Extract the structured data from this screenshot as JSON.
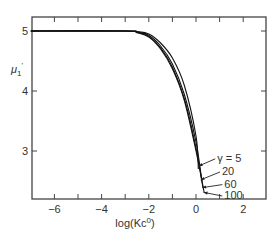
{
  "chart_data": {
    "type": "line",
    "title": "",
    "xlabel": "log(Kc0)",
    "xlabel_display": {
      "base": "log(Kc",
      "sup": "0",
      "tail": ")"
    },
    "ylabel": "μ1'",
    "ylabel_display": {
      "base": "μ",
      "sub": "1",
      "prime": "'"
    },
    "xlim": [
      -7,
      3
    ],
    "ylim": [
      2.2,
      5.25
    ],
    "xticks": [
      -6,
      -5,
      -4,
      -3,
      -2,
      -1,
      0,
      1,
      2
    ],
    "xtick_labels": [
      {
        "v": -6,
        "t": "−6"
      },
      {
        "v": -4,
        "t": "−4"
      },
      {
        "v": -2,
        "t": "−2"
      },
      {
        "v": 0,
        "t": "0"
      },
      {
        "v": 2,
        "t": "2"
      }
    ],
    "yticks": [
      3,
      4,
      5
    ],
    "ytick_labels": [
      {
        "v": 3,
        "t": "3"
      },
      {
        "v": 4,
        "t": "4"
      },
      {
        "v": 5,
        "t": "5"
      }
    ],
    "grid": false,
    "legend": "annotations",
    "series": [
      {
        "name": "γ = 5",
        "label": "γ = 5",
        "x": [
          -7,
          -3,
          -2.5,
          -2,
          -1.5,
          -1,
          -0.5,
          0,
          0.1
        ],
        "y": [
          5,
          5,
          4.99,
          4.95,
          4.8,
          4.55,
          4.1,
          3.25,
          2.7
        ]
      },
      {
        "name": "γ = 20",
        "label": "20",
        "x": [
          -7,
          -3,
          -2.5,
          -2,
          -1.5,
          -1,
          -0.5,
          0,
          0.25
        ],
        "y": [
          5,
          5,
          4.98,
          4.93,
          4.75,
          4.45,
          3.95,
          3.15,
          2.5
        ]
      },
      {
        "name": "γ = 60",
        "label": "60",
        "x": [
          -7,
          -3,
          -2.5,
          -2,
          -1.5,
          -1,
          -0.5,
          0,
          0.3
        ],
        "y": [
          5,
          5,
          4.98,
          4.91,
          4.72,
          4.4,
          3.88,
          3.05,
          2.38
        ]
      },
      {
        "name": "γ = 100",
        "label": "100",
        "x": [
          -7,
          -3,
          -2.5,
          -2,
          -1.5,
          -1,
          -0.5,
          0,
          0.35
        ],
        "y": [
          5,
          5,
          4.97,
          4.9,
          4.7,
          4.37,
          3.85,
          3.0,
          2.3
        ]
      }
    ],
    "annotations": [
      {
        "text": "γ = 5",
        "x": 0.9,
        "y": 2.82,
        "arrow_to": [
          0.12,
          2.75
        ]
      },
      {
        "text": "20",
        "x": 1.1,
        "y": 2.6,
        "arrow_to": [
          0.2,
          2.52
        ]
      },
      {
        "text": "60",
        "x": 1.2,
        "y": 2.39,
        "arrow_to": [
          0.27,
          2.39
        ]
      },
      {
        "text": "100",
        "x": 1.2,
        "y": 2.2,
        "arrow_to": [
          0.33,
          2.31
        ]
      }
    ]
  }
}
